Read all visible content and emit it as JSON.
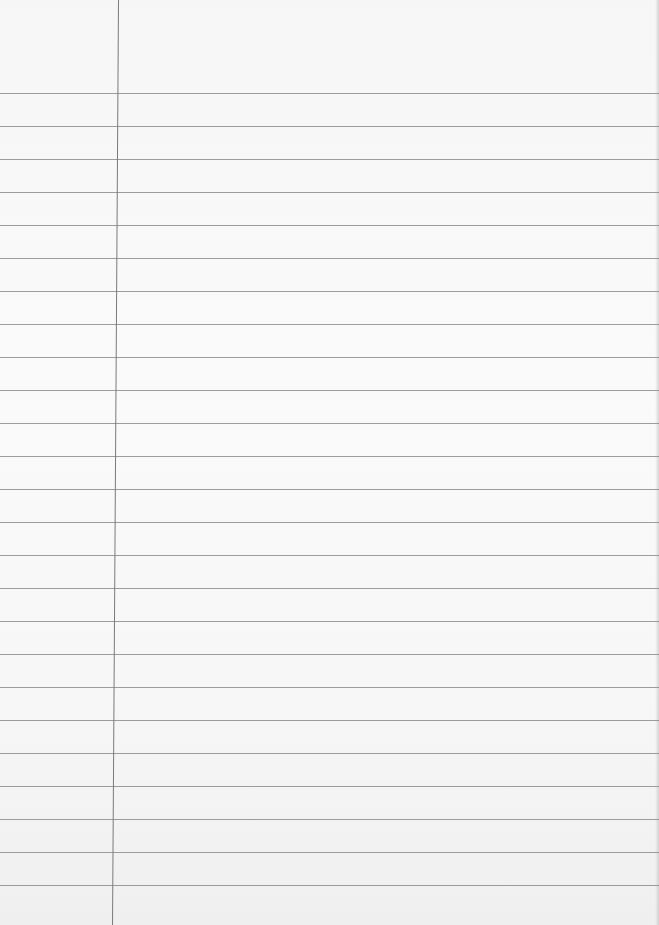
{
  "paper": {
    "type": "lined-notebook-page",
    "rule_color": "#8c8c8c",
    "margin_color": "#7a7a7a",
    "background": "#f8f8f8",
    "first_rule_y": 93,
    "rule_spacing": 33,
    "rule_count": 25,
    "margin_x_top": 118,
    "margin_x_bottom": 124
  }
}
